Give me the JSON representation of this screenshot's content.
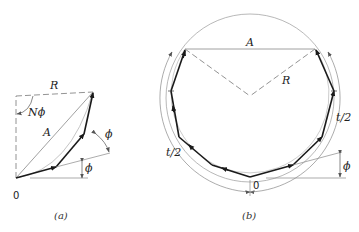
{
  "figure_a": {
    "caption": "(a)",
    "labels": {
      "R": "R",
      "N_phi": "Nϕ",
      "A": "A",
      "phi_upper": "ϕ",
      "phi_lower": "ϕ",
      "origin": "0"
    }
  },
  "figure_b": {
    "caption": "(b)",
    "labels": {
      "A": "A",
      "R": "R",
      "t_half_right": "t/2",
      "t_half_left": "t/2",
      "phi": "ϕ",
      "origin": "0"
    }
  },
  "colors": {
    "phasor": "#1a1a1a",
    "construction": "#8a8a8a",
    "text": "#222222"
  }
}
